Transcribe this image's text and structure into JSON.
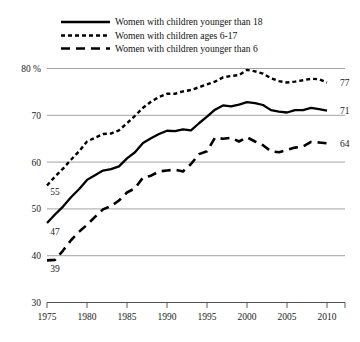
{
  "chart_data": {
    "type": "line",
    "title": "",
    "subtitle": "",
    "xlabel": "",
    "ylabel": "",
    "ylim": [
      30,
      82
    ],
    "xlim": [
      1975,
      2011
    ],
    "grid": true,
    "y_unit_suffix": "%",
    "y_ticks": [
      30,
      40,
      50,
      60,
      70,
      80
    ],
    "y_tick_labels": [
      "30",
      "40",
      "50",
      "60",
      "70",
      "80 %"
    ],
    "x_ticks": [
      1975,
      1980,
      1985,
      1990,
      1995,
      2000,
      2005,
      2010
    ],
    "x_tick_labels": [
      "1975",
      "1980",
      "1985",
      "1990",
      "1995",
      "2000",
      "2005",
      "2010"
    ],
    "legend_position": "top-center",
    "x": [
      1975,
      1976,
      1977,
      1978,
      1979,
      1980,
      1981,
      1982,
      1983,
      1984,
      1985,
      1986,
      1987,
      1988,
      1989,
      1990,
      1991,
      1992,
      1993,
      1994,
      1995,
      1996,
      1997,
      1998,
      1999,
      2000,
      2001,
      2002,
      2003,
      2004,
      2005,
      2006,
      2007,
      2008,
      2009,
      2010
    ],
    "series": [
      {
        "name": "Women with children younger than 18",
        "line_style": "solid",
        "color": "#000000",
        "start_label": "47",
        "end_label": "71",
        "values": [
          47,
          48.8,
          50.5,
          52.5,
          54.2,
          56.2,
          57.2,
          58.2,
          58.5,
          59.1,
          60.8,
          62.1,
          64.1,
          65.1,
          66.0,
          66.7,
          66.6,
          67.0,
          66.8,
          68.3,
          69.7,
          71.2,
          72.1,
          71.9,
          72.3,
          72.8,
          72.6,
          72.2,
          71.1,
          70.8,
          70.6,
          71.1,
          71.1,
          71.6,
          71.3,
          71.0
        ]
      },
      {
        "name": "Women with children ages 6-17",
        "line_style": "dotted",
        "color": "#000000",
        "start_label": "55",
        "end_label": "77",
        "values": [
          55,
          56.9,
          58.6,
          60.5,
          62.3,
          64.4,
          65.2,
          66.0,
          66.1,
          66.8,
          68.3,
          69.9,
          71.6,
          72.9,
          73.9,
          74.6,
          74.6,
          75.1,
          75.4,
          76.0,
          76.6,
          77.2,
          78.1,
          78.4,
          78.6,
          79.7,
          79.4,
          78.9,
          77.9,
          77.3,
          77.0,
          77.2,
          77.5,
          77.8,
          77.7,
          77.0
        ]
      },
      {
        "name": "Women with children younger than 6",
        "line_style": "dashed",
        "color": "#000000",
        "start_label": "39",
        "end_label": "64",
        "values": [
          39,
          39.1,
          41.1,
          43.3,
          45.1,
          46.6,
          48.3,
          49.9,
          50.6,
          51.8,
          53.5,
          54.4,
          56.7,
          57.1,
          58.0,
          58.2,
          58.4,
          58.0,
          59.6,
          61.7,
          62.3,
          65.2,
          65.0,
          65.2,
          64.4,
          65.3,
          64.4,
          63.6,
          62.3,
          62.1,
          62.6,
          63.1,
          63.3,
          64.3,
          64.2,
          64.0
        ]
      }
    ]
  },
  "legend": {
    "items": [
      {
        "label": "Women with children younger than 18",
        "style": "solid"
      },
      {
        "label": "Women with children ages 6-17",
        "style": "dotted"
      },
      {
        "label": "Women with children younger than 6",
        "style": "dashed"
      }
    ]
  }
}
